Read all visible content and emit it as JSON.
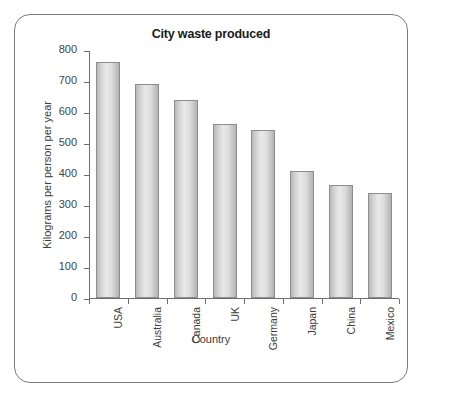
{
  "chart_data": {
    "type": "bar",
    "title": "City waste produced",
    "xlabel": "Country",
    "ylabel": "Kilograms per person per year",
    "categories": [
      "USA",
      "Australia",
      "Canada",
      "UK",
      "Germany",
      "Japan",
      "China",
      "Mexico"
    ],
    "values": [
      760,
      690,
      637,
      560,
      540,
      408,
      363,
      338
    ],
    "ylim": [
      0,
      800
    ],
    "ytick_step": 100,
    "yticks": [
      0,
      100,
      200,
      300,
      400,
      500,
      600,
      700,
      800
    ],
    "ytick_labels": [
      "0",
      "100",
      "200",
      "300",
      "400",
      "500",
      "600",
      "700",
      "800"
    ],
    "grid": false,
    "legend": false,
    "legend_position": "none",
    "colors": {
      "bar_fill_light": "#e9e9e9",
      "bar_fill_dark": "#b3b3b3",
      "bar_border": "#8d8d8d",
      "axis": "#6e6e6e",
      "frame_border": "#7b7b7b",
      "title_text": "#1b1b1b",
      "label_text": "#3d3d3d",
      "background": "#ffffff"
    }
  }
}
